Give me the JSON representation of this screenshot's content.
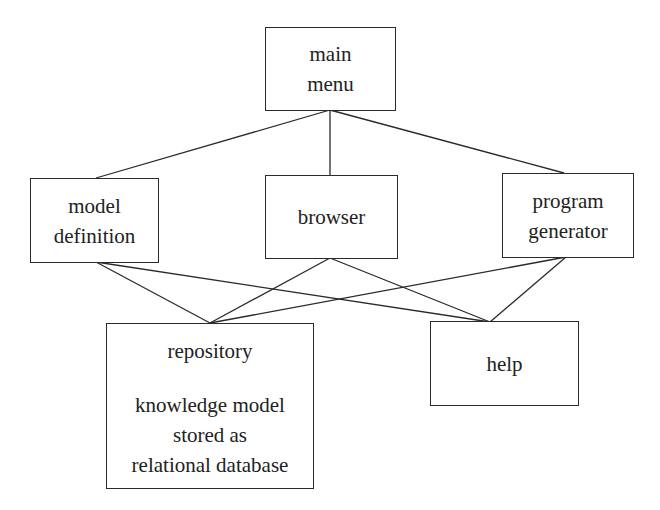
{
  "diagram": {
    "nodes": {
      "main_menu": {
        "lines": [
          "main",
          "menu"
        ]
      },
      "model_definition": {
        "lines": [
          "model",
          "definition"
        ]
      },
      "browser": {
        "lines": [
          "browser"
        ]
      },
      "program_generator": {
        "lines": [
          "program",
          "generator"
        ]
      },
      "repository": {
        "title": "repository",
        "lines": [
          "knowledge model",
          "stored as",
          "relational database"
        ]
      },
      "help": {
        "lines": [
          "help"
        ]
      }
    },
    "edges": [
      [
        "main menu",
        "model definition"
      ],
      [
        "main menu",
        "browser"
      ],
      [
        "main menu",
        "program generator"
      ],
      [
        "model definition",
        "repository"
      ],
      [
        "model definition",
        "help"
      ],
      [
        "browser",
        "repository"
      ],
      [
        "browser",
        "help"
      ],
      [
        "program generator",
        "repository"
      ],
      [
        "program generator",
        "help"
      ]
    ],
    "colors": {
      "stroke": "#2a2a2a",
      "text": "#222222",
      "background": "#ffffff"
    }
  }
}
